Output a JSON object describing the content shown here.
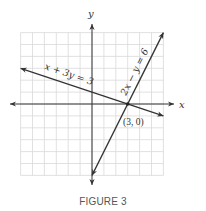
{
  "chart_data": {
    "type": "line",
    "title": "",
    "caption": "FIGURE 3",
    "xlabel": "x",
    "ylabel": "y",
    "xlim": [
      -6,
      6
    ],
    "ylim": [
      -6,
      6
    ],
    "grid": true,
    "grid_step": 1,
    "tick_labels": false,
    "series": [
      {
        "name": "x + 3y = 3",
        "label": "x + 3y = 3",
        "equation": "x + 3y = 3",
        "x": [
          -6,
          6
        ],
        "y": [
          3,
          -1
        ],
        "arrows": "both"
      },
      {
        "name": "2x − y = 6",
        "label": "2x − y = 6",
        "equation": "2x - y = 6",
        "x": [
          0,
          6
        ],
        "y": [
          -6,
          6
        ],
        "arrows": "both"
      }
    ],
    "annotations": [
      {
        "text": "(3, 0)",
        "x": 3,
        "y": 0,
        "type": "intersection-point"
      }
    ]
  },
  "colors": {
    "grid": "#d9d9d9",
    "axis": "#333333",
    "line": "#333333",
    "caption": "#555555"
  }
}
